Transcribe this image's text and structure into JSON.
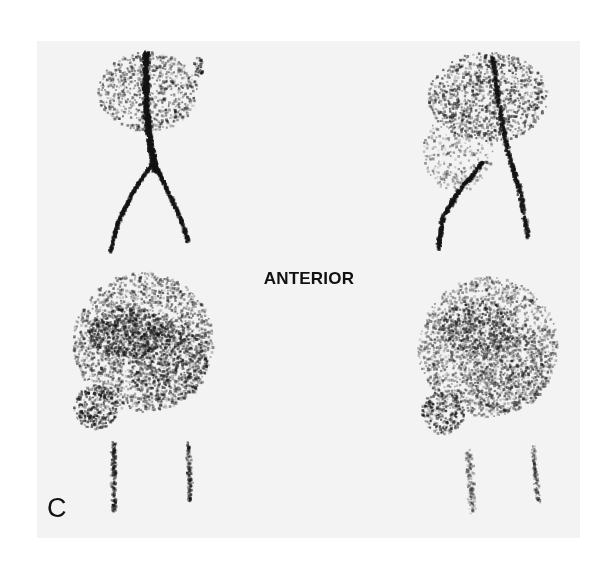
{
  "figure": {
    "view_label": "ANTERIOR",
    "panel_letter": "C",
    "images": [
      {
        "position": "top-left",
        "description": "vascular-phase scintigram, aortic bifurcation"
      },
      {
        "position": "top-right",
        "description": "vascular-phase scintigram, aortic bifurcation"
      },
      {
        "position": "bottom-left",
        "description": "blood-pool scintigram, pelvis"
      },
      {
        "position": "bottom-right",
        "description": "blood-pool scintigram, pelvis"
      }
    ],
    "colors": {
      "background": "#ffffff",
      "panel": "#f3f3f3",
      "ink": "#111111"
    }
  }
}
